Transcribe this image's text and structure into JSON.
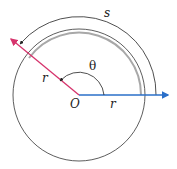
{
  "diagram": {
    "labels": {
      "arc": "s",
      "angle": "θ",
      "radius_left": "r",
      "radius_right": "r",
      "center": "O"
    },
    "colors": {
      "initial_ray": "#2a6fc9",
      "terminal_ray": "#d6336c",
      "highlight_arc": "#a8a8a8",
      "circle": "#333333"
    }
  }
}
